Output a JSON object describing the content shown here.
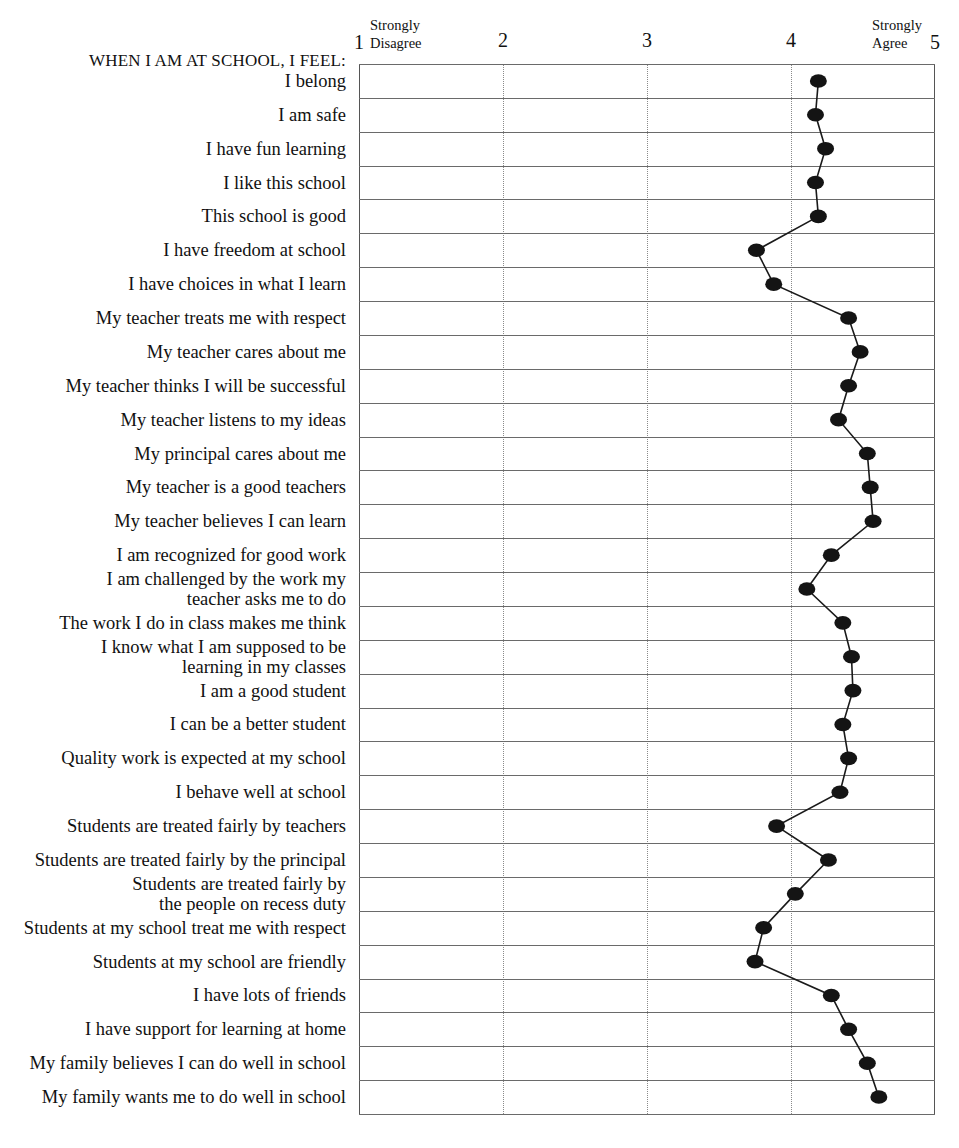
{
  "chart_data": {
    "type": "line",
    "title": "",
    "subtitle": "",
    "xlabel": "",
    "ylabel": "",
    "orientation": "horizontal",
    "xlim": [
      1,
      5
    ],
    "xticks": [
      1,
      2,
      3,
      4,
      5
    ],
    "xtick_labels": [
      "1",
      "2",
      "3",
      "4",
      "5"
    ],
    "scale_anchor_low": {
      "line1": "Strongly",
      "line2": "Disagree"
    },
    "scale_anchor_high": {
      "line1": "Strongly",
      "line2": "Agree"
    },
    "grid": {
      "horizontal": true,
      "vertical": true,
      "vertical_style": "dotted"
    },
    "legend": null,
    "marker": {
      "shape": "circle",
      "color": "#141414",
      "size": 17
    },
    "line": {
      "color": "#1a1a1a",
      "width": 1.6
    },
    "section_heading": "WHEN I AM AT SCHOOL, I FEEL:",
    "categories": [
      "I belong",
      "I am safe",
      "I have fun learning",
      "I like this school",
      "This school is good",
      "I have freedom at school",
      "I have choices in what I learn",
      "My teacher treats me with respect",
      "My teacher cares about me",
      "My teacher thinks I will be successful",
      "My teacher listens to my ideas",
      "My principal cares about me",
      "My teacher is a good teachers",
      "My teacher believes I can learn",
      "I am recognized for good work",
      "I am challenged by the work my teacher asks me to do",
      "The work I do in class makes me think",
      "I know what I am supposed to be learning in my classes",
      "I am a good student",
      "I can be a better student",
      "Quality work is expected at my school",
      "I behave well at school",
      "Students are treated fairly by teachers",
      "Students are treated fairly by the principal",
      "Students are treated fairly by the people on recess duty",
      "Students at my school treat me with respect",
      "Students at my school are friendly",
      "I have lots of friends",
      "I have support for learning at home",
      "My family believes I can do well in school",
      "My family wants me to do well in school"
    ],
    "categories_wrapped": [
      [
        "I belong"
      ],
      [
        "I am safe"
      ],
      [
        "I have fun learning"
      ],
      [
        "I like this school"
      ],
      [
        "This school is good"
      ],
      [
        "I have freedom at school"
      ],
      [
        "I have choices in what I learn"
      ],
      [
        "My teacher treats me with respect"
      ],
      [
        "My teacher cares about me"
      ],
      [
        "My teacher thinks I will be successful"
      ],
      [
        "My teacher listens to my ideas"
      ],
      [
        "My principal cares about me"
      ],
      [
        "My teacher is a good teachers"
      ],
      [
        "My teacher believes I can learn"
      ],
      [
        "I am recognized for good work"
      ],
      [
        "I am challenged by the work my",
        "teacher asks me to do"
      ],
      [
        "The work I do in class makes me think"
      ],
      [
        "I know what I am supposed to be",
        "learning in my classes"
      ],
      [
        "I am a good student"
      ],
      [
        "I can be a better student"
      ],
      [
        "Quality work is expected at my school"
      ],
      [
        "I behave well at school"
      ],
      [
        "Students are treated fairly by teachers"
      ],
      [
        "Students are treated fairly by the principal"
      ],
      [
        "Students are treated fairly by",
        "the people on recess duty"
      ],
      [
        "Students at my school treat me with respect"
      ],
      [
        "Students at my school are friendly"
      ],
      [
        "I have lots of friends"
      ],
      [
        "I have support for learning at home"
      ],
      [
        "My family believes I can do well in school"
      ],
      [
        "My family wants me to do well in school"
      ]
    ],
    "values": [
      4.19,
      4.17,
      4.24,
      4.17,
      4.19,
      3.76,
      3.88,
      4.4,
      4.48,
      4.4,
      4.33,
      4.53,
      4.55,
      4.57,
      4.28,
      4.11,
      4.36,
      4.42,
      4.43,
      4.36,
      4.4,
      4.34,
      3.9,
      4.26,
      4.03,
      3.81,
      3.75,
      4.28,
      4.4,
      4.53,
      4.61
    ]
  }
}
